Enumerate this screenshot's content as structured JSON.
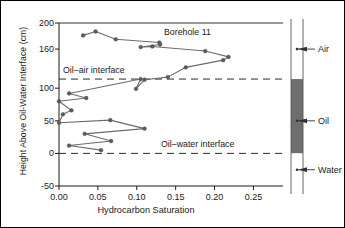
{
  "chart_data": {
    "type": "line",
    "title": "Borehole 11",
    "xlabel": "Hydrocarbon Saturation",
    "ylabel": "Height Above Oil-Water Interface (cm)",
    "xlim": [
      0.0,
      0.27
    ],
    "ylim": [
      -50,
      200
    ],
    "xticks": [
      0.0,
      0.05,
      0.1,
      0.15,
      0.2,
      0.25
    ],
    "xtick_labels": [
      "0.00",
      "0.05",
      "0.10",
      "0.15",
      "0.20",
      "0.25"
    ],
    "yticks": [
      200,
      160,
      100,
      50,
      0,
      -50
    ],
    "ytick_labels": [
      "200",
      "160",
      "100",
      "50",
      "0",
      "-50"
    ],
    "grid": false,
    "legend": "none",
    "marker": "filled-circle",
    "series": [
      {
        "name": "Hydrocarbon saturation profile",
        "x": [
          0.031,
          0.047,
          0.073,
          0.129,
          0.13,
          0.105,
          0.12,
          0.188,
          0.218,
          0.211,
          0.163,
          0.14,
          0.11,
          0.099,
          0.105,
          0.013,
          0.035,
          0.0,
          0.016,
          0.005,
          0.0,
          0.066,
          0.11,
          0.033,
          0.067,
          0.013,
          0.054
        ],
        "y": [
          181,
          187,
          175,
          170,
          167,
          163,
          164,
          157,
          148,
          143,
          132,
          117,
          113,
          99,
          114,
          92,
          85,
          80,
          66,
          60,
          47,
          51,
          38,
          30,
          19,
          12,
          5
        ],
        "color": "#6b6b6b"
      }
    ],
    "annotations": [
      {
        "name": "oil-air-interface",
        "label": "Oil–air interface",
        "y": 114,
        "style": "dashed"
      },
      {
        "name": "oil-water-interface",
        "label": "Oil–water interface",
        "y": 0,
        "style": "dashed"
      }
    ],
    "stratigraphy": {
      "layers": [
        {
          "name": "Air",
          "label": "Air",
          "top": 200,
          "bottom": 114,
          "color": "#ffffff"
        },
        {
          "name": "Oil",
          "label": "Oil",
          "top": 114,
          "bottom": 0,
          "color": "#6e6e6e"
        },
        {
          "name": "Water",
          "label": "Water",
          "top": 0,
          "bottom": -50,
          "color": "#ffffff"
        }
      ],
      "label_positions": [
        160,
        50,
        -25
      ]
    }
  },
  "colors": {
    "line": "#6b6b6b",
    "marker": "#5a5a5a",
    "axis": "#1a1a1a",
    "oil_fill": "#6e6e6e",
    "frame": "#000000"
  }
}
